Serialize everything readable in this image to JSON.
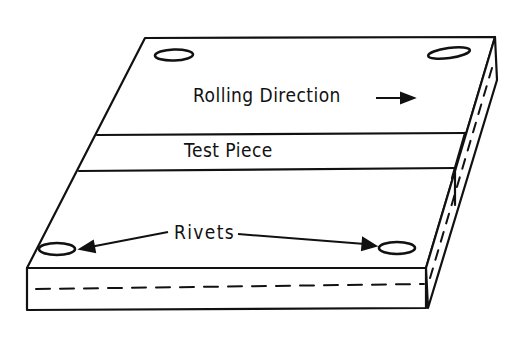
{
  "diagram": {
    "labels": {
      "rolling_direction": "Rolling Direction",
      "test_piece": "Test Piece",
      "rivets": "Rivets"
    },
    "colors": {
      "line": "#111111",
      "background": "#ffffff"
    }
  }
}
